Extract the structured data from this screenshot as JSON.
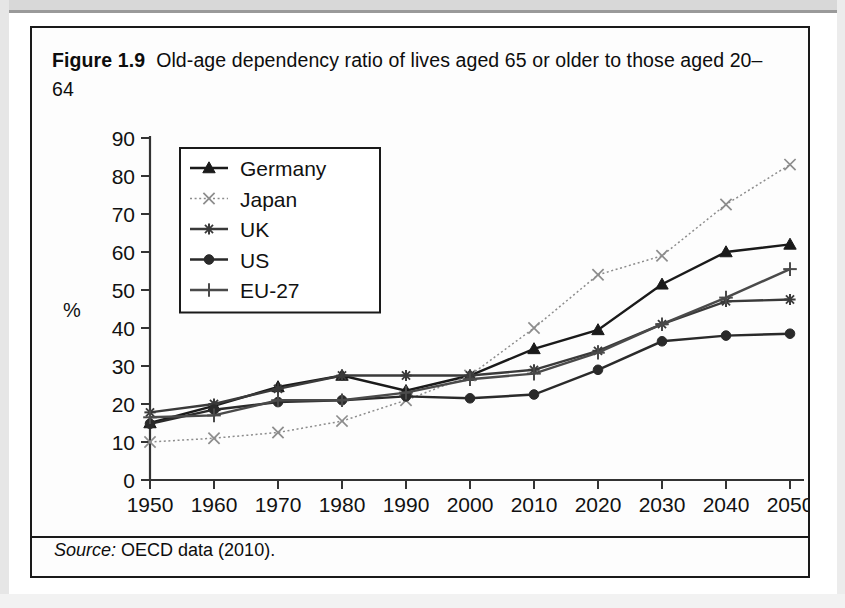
{
  "figure": {
    "label": "Figure 1.9",
    "caption": "Old-age dependency ratio of lives aged 65 or older to those aged 20–64",
    "source_word": "Source:",
    "source_text": "OECD data (2010)."
  },
  "chart_data": {
    "type": "line",
    "xlabel": "",
    "ylabel": "%",
    "x": [
      1950,
      1960,
      1970,
      1980,
      1990,
      2000,
      2010,
      2020,
      2030,
      2040,
      2050
    ],
    "xlim": [
      1950,
      2050
    ],
    "ylim": [
      0,
      90
    ],
    "ytick_step": 10,
    "yticks": [
      0,
      10,
      20,
      30,
      40,
      50,
      60,
      70,
      80,
      90
    ],
    "xticks": [
      "1950",
      "1960",
      "1970",
      "1980",
      "1990",
      "2000",
      "2010",
      "2020",
      "2030",
      "2040",
      "2050"
    ],
    "grid": false,
    "legend_position": "upper-left-inset",
    "series": [
      {
        "name": "Germany",
        "marker": "triangle",
        "color": "#1a1a1a",
        "dash": "solid",
        "values": [
          15.0,
          19.5,
          24.5,
          27.5,
          23.5,
          27.5,
          34.5,
          39.5,
          51.5,
          60.0,
          62.0
        ]
      },
      {
        "name": "Japan",
        "marker": "x",
        "color": "#8c8c8c",
        "dash": "dotted",
        "values": [
          10.0,
          11.0,
          12.5,
          15.5,
          21.0,
          27.5,
          40.0,
          54.0,
          59.0,
          72.5,
          83.0
        ]
      },
      {
        "name": "UK",
        "marker": "star",
        "color": "#3a3a3a",
        "dash": "solid",
        "values": [
          17.8,
          20.0,
          24.0,
          27.5,
          27.5,
          27.5,
          29.0,
          34.0,
          41.0,
          47.0,
          47.5
        ]
      },
      {
        "name": "US",
        "marker": "circle",
        "color": "#2a2a2a",
        "dash": "solid",
        "values": [
          14.8,
          18.5,
          20.5,
          21.0,
          22.0,
          21.5,
          22.5,
          29.0,
          36.5,
          38.0,
          38.5
        ]
      },
      {
        "name": "EU-27",
        "marker": "plus",
        "color": "#4a4a4a",
        "dash": "solid",
        "values": [
          16.5,
          17.0,
          21.0,
          21.0,
          23.0,
          26.5,
          28.0,
          33.5,
          41.0,
          48.0,
          55.5
        ]
      }
    ]
  }
}
